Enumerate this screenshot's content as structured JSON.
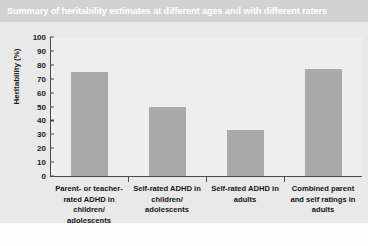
{
  "title": "Summary of heritability estimates at different ages and with different raters",
  "colors": {
    "title_band": "#d2d2d2",
    "title_text": "#ffffff",
    "panel": "#e9e9e9",
    "plot_area": "#eeeeee",
    "bar": "#a9a9a9",
    "axis": "#4a4a4a",
    "text": "#151515"
  },
  "chart_data": {
    "type": "bar",
    "title": "Summary of heritability estimates at different ages and with different raters",
    "categories": [
      "Parent- or teacher- rated ADHD in children/ adolescents",
      "Self-rated ADHD in children/ adolescents",
      "Self-rated ADHD in adults",
      "Combined parent and self ratings in adults"
    ],
    "values": [
      75,
      50,
      33,
      77
    ],
    "xlabel": "",
    "ylabel": "Heritability (%)",
    "ylim": [
      0,
      100
    ],
    "yticks": [
      0,
      10,
      20,
      30,
      40,
      50,
      60,
      70,
      80,
      90,
      100
    ],
    "ytick_labels": [
      "0",
      "10",
      "20",
      "30",
      "40",
      "50",
      "60",
      "70",
      "80",
      "90",
      "100"
    ],
    "grid": false,
    "legend": null
  }
}
